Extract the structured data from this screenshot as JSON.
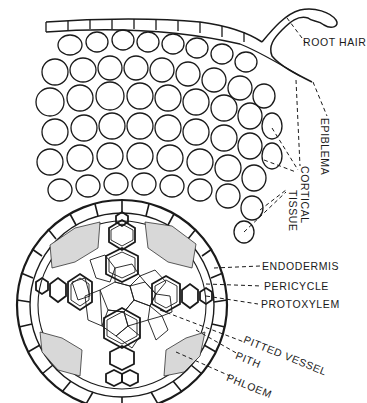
{
  "diagram": {
    "colors": {
      "ink": "#1a1a1a",
      "paper": "#ffffff",
      "stipple": "#555555"
    },
    "labels": [
      {
        "id": "root-hair",
        "text": "ROOT HAIR",
        "x": 303,
        "y": 43,
        "rotate": 0
      },
      {
        "id": "epiblema",
        "text": "EPIBLEMA",
        "x": 316,
        "y": 118,
        "rotate": 90
      },
      {
        "id": "cortical",
        "text": "CORTICAL",
        "x": 296,
        "y": 168,
        "rotate": 90
      },
      {
        "id": "tissue",
        "text": "TISSUE",
        "x": 283,
        "y": 190,
        "rotate": 90
      },
      {
        "id": "endodermis",
        "text": "ENDODERMIS",
        "x": 262,
        "y": 263,
        "rotate": 0
      },
      {
        "id": "pericycle",
        "text": "PERICYCLE",
        "x": 264,
        "y": 283,
        "rotate": 0
      },
      {
        "id": "protoxylem",
        "text": "PROTOXYLEM",
        "x": 261,
        "y": 301,
        "rotate": 0
      },
      {
        "id": "pitted-vessel",
        "text": "PITTED VESSEL",
        "x": 246,
        "y": 342,
        "rotate": 22
      },
      {
        "id": "pith",
        "text": "PITH",
        "x": 239,
        "y": 357,
        "rotate": 22
      },
      {
        "id": "phloem",
        "text": "PHLOEM",
        "x": 230,
        "y": 380,
        "rotate": 22
      }
    ]
  }
}
